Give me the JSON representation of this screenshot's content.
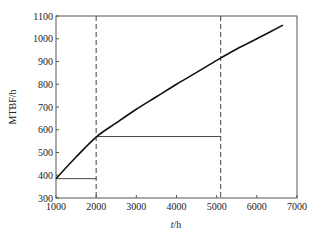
{
  "chart_data": {
    "type": "line",
    "title": "",
    "xlabel": "t/h",
    "ylabel": "MTBF/h",
    "xlim": [
      1000,
      7000
    ],
    "ylim": [
      300,
      1100
    ],
    "grid": false,
    "legend": null,
    "x_ticks": [
      1000,
      2000,
      3000,
      4000,
      5000,
      6000,
      7000
    ],
    "y_ticks": [
      300,
      400,
      500,
      600,
      700,
      800,
      900,
      1000,
      1100
    ],
    "series": [
      {
        "name": "MTBF curve",
        "style": "solid",
        "x": [
          1000,
          1500,
          2000,
          2500,
          3000,
          3500,
          4000,
          4500,
          5000,
          5500,
          6000,
          6650
        ],
        "y": [
          385,
          480,
          568,
          630,
          690,
          745,
          800,
          852,
          905,
          955,
          1000,
          1060
        ]
      }
    ],
    "annotations": [
      {
        "type": "vline",
        "style": "dashed",
        "x": 2000
      },
      {
        "type": "vline",
        "style": "dashed",
        "x": 5100
      },
      {
        "type": "hline-segment",
        "style": "solid",
        "y": 385,
        "x_from": 1000,
        "x_to": 2000
      },
      {
        "type": "hline-segment",
        "style": "solid",
        "y": 570,
        "x_from": 2000,
        "x_to": 5100
      }
    ]
  },
  "axes": {
    "xlabel_italic_part": "t",
    "xlabel_rest": "/h",
    "ylabel": "MTBF/h"
  }
}
